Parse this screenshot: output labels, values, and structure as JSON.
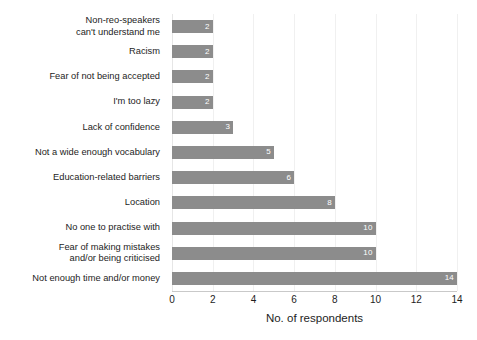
{
  "chart_data": {
    "type": "bar",
    "orientation": "horizontal",
    "title": "",
    "xlabel": "No. of respondents",
    "ylabel": "",
    "xlim": [
      0,
      14
    ],
    "xticks": [
      0,
      2,
      4,
      6,
      8,
      10,
      12,
      14
    ],
    "grid": "vertical-light",
    "legend": null,
    "bar_color": "#8c8c8c",
    "value_label_color": "#ffffff",
    "categories": [
      "Non-reo-speakers\ncan't understand me",
      "Racism",
      "Fear of not being accepted",
      "I'm too lazy",
      "Lack of confidence",
      "Not a wide enough vocabulary",
      "Education-related barriers",
      "Location",
      "No one to practise with",
      "Fear of making mistakes\nand/or being criticised",
      "Not enough time and/or money"
    ],
    "values": [
      2,
      2,
      2,
      2,
      3,
      5,
      6,
      8,
      10,
      10,
      14
    ],
    "value_labels": [
      "2",
      "2",
      "2",
      "2",
      "3",
      "5",
      "6",
      "8",
      "10",
      "10",
      "14"
    ]
  }
}
